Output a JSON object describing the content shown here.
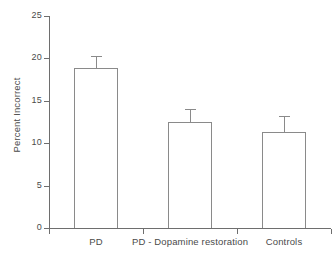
{
  "chart_data": {
    "type": "bar",
    "title": "",
    "subtitle": "",
    "xlabel": "",
    "ylabel": "Percent Incorrect",
    "categories": [
      "PD",
      "PD - Dopamine restoration",
      "Controls"
    ],
    "values": [
      18.9,
      12.5,
      11.3
    ],
    "errors": [
      1.4,
      1.5,
      1.9
    ],
    "error_type": "symmetric",
    "ylim": [
      0,
      25
    ],
    "yticks": [
      0,
      5,
      10,
      15,
      20,
      25
    ],
    "ytick_labels": [
      "0",
      "5",
      "10",
      "15",
      "20",
      "25"
    ],
    "xtick_labels": [
      "PD",
      "PD - Dopamine restoration",
      "Controls"
    ],
    "grid": false,
    "legend": null,
    "legend_position": "none",
    "bar_fill": "none",
    "bar_edge_color": "#8a8a8a",
    "axis_color": "#6e6e6e",
    "text_color": "#4a4a4a",
    "background": "#ffffff",
    "annotations": []
  },
  "axes": {
    "y_title": "Percent Incorrect"
  }
}
